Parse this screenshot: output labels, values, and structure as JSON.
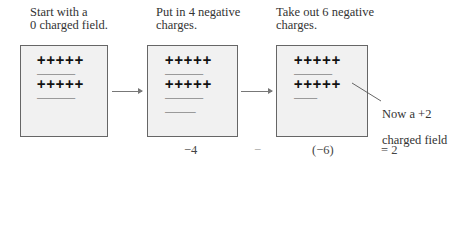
{
  "panels": [
    {
      "caption": "Start with a\n0 charged field.",
      "rows": [
        "+++++",
        "-----",
        "+++++",
        "-----"
      ],
      "charge_counts": {
        "positive": 10,
        "negative": 10
      }
    },
    {
      "caption": "Put in 4 negative\ncharges.",
      "rows": [
        "+++++",
        "-----",
        "+++++",
        "-----",
        "----"
      ],
      "charge_counts": {
        "positive": 10,
        "negative": 14
      }
    },
    {
      "caption": "Take out 6 negative\ncharges.",
      "rows": [
        "+++++",
        "-----",
        "+++++",
        "---"
      ],
      "charge_counts": {
        "positive": 10,
        "negative": 8
      }
    }
  ],
  "annotation": {
    "line1": "Now a +2",
    "line2": "charged field"
  },
  "equation": {
    "term1": "−4",
    "operator": "−",
    "term2": "(−6)",
    "result": "= 2"
  }
}
